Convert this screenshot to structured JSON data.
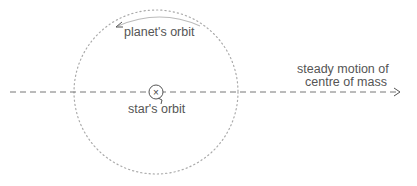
{
  "diagram": {
    "labels": {
      "planet_orbit": "planet's orbit",
      "star_orbit": "star's orbit",
      "centre_of_mass_line1": "steady motion of",
      "centre_of_mass_line2": "centre of mass"
    },
    "star_marker_glyph": "×",
    "colors": {
      "line": "#777777",
      "orbit_dots": "#aaaaaa",
      "text": "#555555",
      "planet_arc": "#bbbbbb"
    }
  }
}
